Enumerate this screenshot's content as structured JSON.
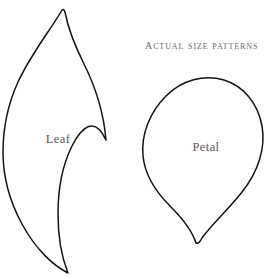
{
  "page": {
    "background_color": "#ffffff",
    "width": 269,
    "height": 277,
    "document_type": "craft pattern sheet"
  },
  "heading": {
    "title": "Actual size patterns",
    "color": "#6e6a6a"
  },
  "shapes": [
    {
      "id": "leaf",
      "label": "Leaf",
      "label_color": "#5c5858",
      "outline_color": "#141414",
      "fill_color": "none",
      "description": "pointed leaf outline, tips at top and bottom"
    },
    {
      "id": "petal",
      "label": "Petal",
      "label_color": "#5c5858",
      "outline_color": "#141414",
      "fill_color": "none",
      "description": "rounded petal outline, point at bottom"
    }
  ]
}
